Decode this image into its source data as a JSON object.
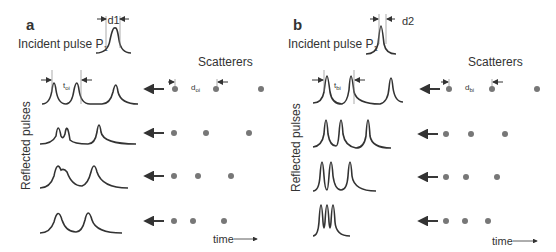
{
  "panels": [
    {
      "label": "a",
      "incident": "Incident pulse P",
      "incident_sub": "1",
      "width_label": "d1",
      "scatterers_title": "Scatterers",
      "ylabel": "Reflected pulses",
      "t_label": "t",
      "t_sub": "oi",
      "d_label": "d",
      "d_sub": "oi",
      "time_label": "time"
    },
    {
      "label": "b",
      "incident": "Incident pulse P",
      "incident_sub": "1",
      "width_label": "d2",
      "scatterers_title": "Scatterers",
      "ylabel": "Reflected pulses",
      "t_label": "t",
      "t_sub": "bi",
      "d_label": "d",
      "d_sub": "bi",
      "time_label": "time"
    }
  ],
  "colors": {
    "line": "#333333",
    "dot": "#777777"
  }
}
